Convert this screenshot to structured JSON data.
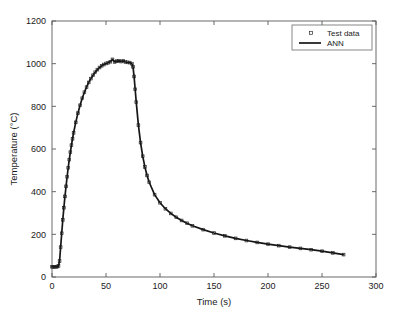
{
  "chart_data": {
    "type": "line",
    "title": "",
    "xlabel": "Time (s)",
    "ylabel": "Temperature (°C)",
    "xlim": [
      0,
      300
    ],
    "ylim": [
      0,
      1200
    ],
    "xticks": [
      0,
      50,
      100,
      150,
      200,
      250,
      300
    ],
    "yticks": [
      0,
      200,
      400,
      600,
      800,
      1000,
      1200
    ],
    "xtick_labels": [
      "0",
      "50",
      "100",
      "150",
      "200",
      "250",
      "300"
    ],
    "ytick_labels": [
      "0",
      "200",
      "400",
      "600",
      "800",
      "1000",
      "1200"
    ],
    "grid": false,
    "legend_position": "upper right",
    "legend": [
      "Test data",
      "ANN"
    ],
    "series": [
      {
        "name": "Test data",
        "marker": "square",
        "x": [
          0,
          1,
          2,
          3,
          4,
          5,
          6,
          7,
          8,
          9,
          10,
          11,
          12,
          13,
          14,
          15,
          16,
          17,
          18,
          19,
          20,
          22,
          24,
          26,
          28,
          30,
          32,
          34,
          36,
          38,
          40,
          42,
          44,
          46,
          48,
          50,
          52,
          54,
          56,
          58,
          60,
          62,
          64,
          66,
          68,
          70,
          72,
          74,
          75,
          76,
          77,
          78,
          80,
          82,
          84,
          86,
          88,
          90,
          95,
          100,
          105,
          110,
          115,
          120,
          125,
          130,
          140,
          150,
          160,
          170,
          180,
          190,
          200,
          210,
          220,
          230,
          240,
          250,
          260,
          270
        ],
        "y": [
          48,
          48,
          48,
          48,
          48,
          49,
          52,
          75,
          140,
          205,
          268,
          325,
          378,
          425,
          470,
          512,
          550,
          585,
          618,
          648,
          676,
          725,
          768,
          805,
          838,
          866,
          890,
          912,
          930,
          946,
          960,
          972,
          982,
          990,
          996,
          1001,
          1004,
          1009,
          1020,
          1008,
          1012,
          1013,
          1010,
          1013,
          1008,
          1006,
          1005,
          1000,
          985,
          940,
          880,
          820,
          712,
          630,
          566,
          516,
          476,
          444,
          386,
          348,
          320,
          298,
          280,
          265,
          252,
          240,
          222,
          206,
          193,
          181,
          171,
          162,
          154,
          147,
          140,
          134,
          128,
          121,
          113,
          105
        ]
      },
      {
        "name": "ANN",
        "marker": "none",
        "x": [
          0,
          1,
          2,
          3,
          4,
          5,
          6,
          7,
          8,
          9,
          10,
          11,
          12,
          13,
          14,
          15,
          16,
          17,
          18,
          19,
          20,
          22,
          24,
          26,
          28,
          30,
          32,
          34,
          36,
          38,
          40,
          42,
          44,
          46,
          48,
          50,
          52,
          54,
          56,
          58,
          60,
          62,
          64,
          66,
          68,
          70,
          72,
          74,
          75,
          76,
          77,
          78,
          80,
          82,
          84,
          86,
          88,
          90,
          95,
          100,
          105,
          110,
          115,
          120,
          125,
          130,
          140,
          150,
          160,
          170,
          180,
          190,
          200,
          210,
          220,
          230,
          240,
          250,
          260,
          270
        ],
        "y": [
          48,
          48,
          48,
          48,
          48,
          49,
          52,
          75,
          140,
          205,
          268,
          325,
          378,
          425,
          470,
          512,
          550,
          585,
          618,
          648,
          676,
          725,
          768,
          805,
          838,
          866,
          890,
          912,
          930,
          946,
          960,
          972,
          982,
          990,
          996,
          1001,
          1004,
          1009,
          1020,
          1008,
          1012,
          1013,
          1010,
          1013,
          1008,
          1006,
          1005,
          1000,
          985,
          940,
          880,
          820,
          712,
          630,
          566,
          516,
          476,
          444,
          386,
          348,
          320,
          298,
          280,
          265,
          252,
          240,
          222,
          206,
          193,
          181,
          171,
          162,
          154,
          147,
          140,
          134,
          128,
          121,
          113,
          105
        ]
      }
    ]
  },
  "colors": {
    "line": "#161616",
    "axis": "#5a5a5a",
    "background": "#ffffff"
  }
}
